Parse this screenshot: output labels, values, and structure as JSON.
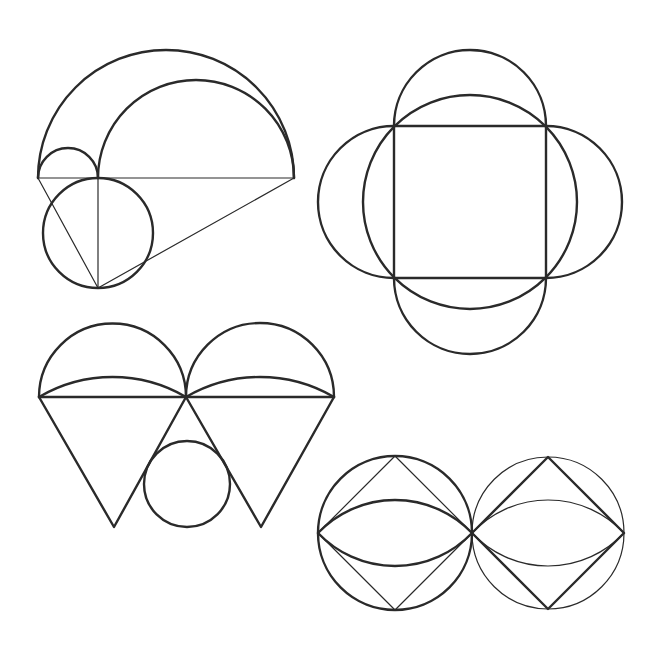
{
  "page": {
    "width": 662,
    "height": 654,
    "background": "#ffffff",
    "stroke_color": "#2a2a2a"
  },
  "figures": [
    {
      "id": "figure-arbelos",
      "description": "Nested semicircles on a common baseline with an inscribed circle below and connecting lines",
      "baseline": {
        "y": 178,
        "x_left": 38,
        "x_split": 98,
        "x_right": 294
      },
      "outer_semicircle": {
        "cx": 166,
        "cy": 178,
        "r": 128
      },
      "small_semicircle": {
        "cx": 68,
        "cy": 178,
        "r": 30
      },
      "large_semicircle": {
        "cx": 196,
        "cy": 178,
        "r": 98
      },
      "lower_circle": {
        "cx": 98,
        "cy": 233,
        "r": 55
      },
      "apex": {
        "x": 98,
        "y": 288
      }
    },
    {
      "id": "figure-square-petals",
      "description": "Square with circumscribed circle and four semicircles on its sides",
      "square": {
        "x": 394,
        "y": 126,
        "size": 152
      },
      "circumcircle": {
        "cx": 470,
        "cy": 202,
        "r": 107
      },
      "petal_radius": 76
    },
    {
      "id": "figure-cones",
      "description": "Two semicircles with arc lenses atop inverted triangles, small circle between",
      "baseline": {
        "y": 397,
        "x_left": 39,
        "x_mid": 186,
        "x_right": 334
      },
      "semicircle_radius": 73.5,
      "lens_sagitta": 20,
      "triangle_tips": [
        {
          "x": 114,
          "y": 527
        },
        {
          "x": 261,
          "y": 527
        }
      ],
      "circle": {
        "cx": 187,
        "cy": 484,
        "r": 43
      }
    },
    {
      "id": "figure-twin-circles",
      "description": "Two tangent circles each with an inscribed diamond and a lens",
      "left": {
        "cx": 395,
        "cy": 533,
        "r": 77,
        "circle_weight": "thick",
        "diamond_weight": "thin",
        "lens_weight": "thick"
      },
      "right": {
        "cx": 548,
        "cy": 533,
        "r": 76,
        "circle_weight": "thin",
        "diamond_weight": "thick",
        "lens_weight": "thin"
      },
      "lens_sagitta": 33
    }
  ]
}
